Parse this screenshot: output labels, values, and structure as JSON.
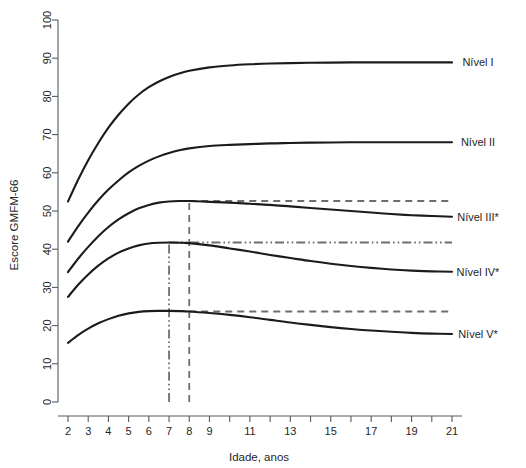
{
  "chart_data": {
    "type": "line",
    "title": "",
    "xlabel": "Idade, anos",
    "ylabel": "Escore GMFM-66",
    "xlim": [
      2,
      21
    ],
    "ylim": [
      0,
      100
    ],
    "grid": false,
    "legend_position": "right-inline",
    "x_ticks": [
      2,
      3,
      4,
      5,
      6,
      7,
      8,
      9,
      10,
      11,
      12,
      13,
      14,
      15,
      16,
      17,
      18,
      19,
      20,
      21
    ],
    "x_tick_labels": [
      "2",
      "3",
      "4",
      "5",
      "6",
      "7",
      "8",
      "9",
      "",
      "11",
      "",
      "13",
      "",
      "15",
      "",
      "17",
      "",
      "19",
      "",
      "21"
    ],
    "y_ticks": [
      0,
      10,
      20,
      30,
      40,
      50,
      60,
      70,
      80,
      90,
      100
    ],
    "y_tick_labels": [
      "0",
      "10",
      "20",
      "30",
      "40",
      "50",
      "60",
      "70",
      "80",
      "90",
      "100"
    ],
    "x": [
      2,
      2.5,
      3,
      3.5,
      4,
      4.5,
      5,
      5.5,
      6,
      6.5,
      7,
      7.5,
      8,
      9,
      10,
      11,
      12,
      13,
      14,
      15,
      16,
      17,
      18,
      19,
      20,
      21
    ],
    "series": [
      {
        "name": "Nível I",
        "label": "Nível I",
        "line_style": "solid",
        "color": "#1b1b1b",
        "values": [
          52.5,
          58.2,
          63.3,
          67.8,
          71.8,
          75.2,
          78.1,
          80.5,
          82.4,
          83.9,
          85.1,
          86.0,
          86.7,
          87.6,
          88.1,
          88.4,
          88.6,
          88.7,
          88.8,
          88.85,
          88.9,
          88.9,
          88.9,
          88.9,
          88.9,
          88.9
        ],
        "end_value": 88.9,
        "has_plateau_marker": false
      },
      {
        "name": "Nível II",
        "label": "Nível II",
        "line_style": "solid",
        "color": "#1b1b1b",
        "values": [
          42.0,
          46.0,
          49.6,
          52.8,
          55.6,
          58.0,
          60.1,
          61.8,
          63.2,
          64.3,
          65.2,
          65.9,
          66.4,
          67.0,
          67.3,
          67.5,
          67.7,
          67.8,
          67.9,
          67.95,
          68.0,
          68.0,
          68.0,
          68.0,
          68.0,
          68.0
        ],
        "end_value": 68.0,
        "has_plateau_marker": false
      },
      {
        "name": "Nível III*",
        "label": "Nível III*",
        "line_style": "solid",
        "color": "#1b1b1b",
        "values": [
          34.0,
          37.5,
          40.6,
          43.4,
          45.8,
          47.8,
          49.4,
          50.7,
          51.6,
          52.2,
          52.5,
          52.6,
          52.6,
          52.4,
          52.2,
          51.9,
          51.6,
          51.2,
          50.8,
          50.4,
          50.0,
          49.6,
          49.2,
          48.9,
          48.7,
          48.5
        ],
        "end_value": 48.5,
        "has_plateau_marker": true,
        "plateau_value": 52.6,
        "plateau_age": 8,
        "plateau_line_style": "dashed"
      },
      {
        "name": "Nível IV*",
        "label": "Nível IV*",
        "line_style": "solid",
        "color": "#1b1b1b",
        "values": [
          27.5,
          30.7,
          33.4,
          35.7,
          37.6,
          39.1,
          40.2,
          41.0,
          41.5,
          41.7,
          41.75,
          41.7,
          41.6,
          41.0,
          40.2,
          39.4,
          38.5,
          37.7,
          36.9,
          36.2,
          35.6,
          35.1,
          34.7,
          34.4,
          34.2,
          34.1
        ],
        "end_value": 34.1,
        "has_plateau_marker": true,
        "plateau_value": 41.75,
        "plateau_age": 7,
        "plateau_line_style": "dashdotdot"
      },
      {
        "name": "Nível V*",
        "label": "Nível V*",
        "line_style": "solid",
        "color": "#1b1b1b",
        "values": [
          15.5,
          17.5,
          19.2,
          20.6,
          21.7,
          22.6,
          23.2,
          23.6,
          23.8,
          23.85,
          23.85,
          23.8,
          23.7,
          23.3,
          22.8,
          22.2,
          21.5,
          20.8,
          20.2,
          19.6,
          19.1,
          18.7,
          18.4,
          18.1,
          17.9,
          17.8
        ],
        "end_value": 17.8,
        "has_plateau_marker": true,
        "plateau_value": 23.7,
        "plateau_age": 8,
        "plateau_line_style": "dashed"
      }
    ],
    "reference_lines": {
      "vertical": [
        {
          "name": "vline-age-7",
          "age": 7,
          "style": "dashdotdot",
          "y_from": 0,
          "y_to": 41.75
        },
        {
          "name": "vline-age-8",
          "age": 8,
          "style": "dashed",
          "y_from": 0,
          "y_to": 52.6
        }
      ],
      "horizontal": [
        {
          "name": "hline-nivel-iii",
          "value": 52.6,
          "style": "dashed",
          "x_from": 8,
          "x_to": 21
        },
        {
          "name": "hline-nivel-iv",
          "value": 41.75,
          "style": "dashdotdot",
          "x_from": 7,
          "x_to": 21
        },
        {
          "name": "hline-nivel-v",
          "value": 23.7,
          "style": "dashed",
          "x_from": 8,
          "x_to": 21
        }
      ]
    }
  },
  "labels": {
    "axis_x_title": "Idade, anos",
    "axis_y_title": "Escore GMFM-66",
    "series_labels": [
      "Nível I",
      "Nível II",
      "Nível III*",
      "Nível IV*",
      "Nível V*"
    ]
  }
}
